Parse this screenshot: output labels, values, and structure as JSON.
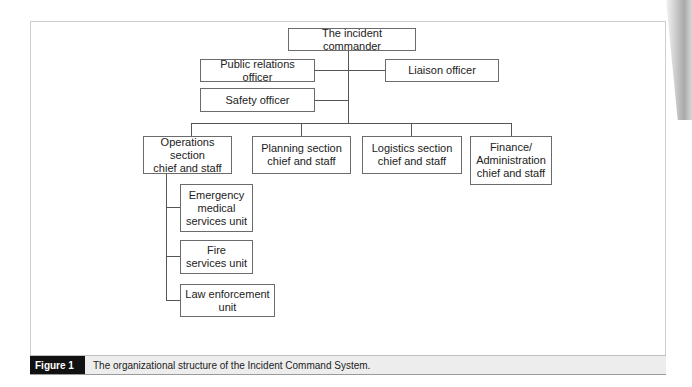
{
  "diagram": {
    "type": "org-chart",
    "root": {
      "id": "ic",
      "label": "The incident commander"
    },
    "command_staff": [
      {
        "id": "pr",
        "label": "Public relations officer",
        "side": "left"
      },
      {
        "id": "liaison",
        "label": "Liaison officer",
        "side": "right"
      },
      {
        "id": "safety",
        "label": "Safety officer",
        "side": "left"
      }
    ],
    "sections": [
      {
        "id": "ops",
        "label": "Operations section\nchief and staff"
      },
      {
        "id": "planning",
        "label": "Planning section\nchief and staff"
      },
      {
        "id": "logistics",
        "label": "Logistics section\nchief and staff"
      },
      {
        "id": "finance",
        "label": "Finance/\nAdministration\nchief and staff"
      }
    ],
    "ops_units": [
      {
        "id": "ems",
        "label": "Emergency\nmedical\nservices unit"
      },
      {
        "id": "fire",
        "label": "Fire\nservices unit"
      },
      {
        "id": "law",
        "label": "Law enforcement\nunit"
      }
    ],
    "edges": [
      [
        "ic",
        "pr"
      ],
      [
        "ic",
        "liaison"
      ],
      [
        "ic",
        "safety"
      ],
      [
        "ic",
        "ops"
      ],
      [
        "ic",
        "planning"
      ],
      [
        "ic",
        "logistics"
      ],
      [
        "ic",
        "finance"
      ],
      [
        "ops",
        "ems"
      ],
      [
        "ops",
        "fire"
      ],
      [
        "ops",
        "law"
      ]
    ]
  },
  "caption": {
    "label": "Figure 1",
    "text": "The organizational structure of the Incident Command System."
  }
}
